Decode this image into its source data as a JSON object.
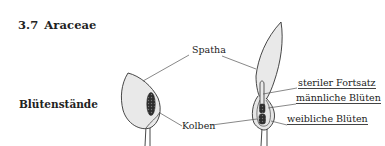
{
  "section": {
    "number": "3.7",
    "title": "Araceae"
  },
  "side_heading": "Blütenstände",
  "figure": {
    "labels": {
      "spatha": "Spatha",
      "kolben": "Kolben",
      "steriler_fortsatz": "steriler Fortsatz",
      "maennliche_blueten": "männliche Blüten",
      "weibliche_blueten": "weibliche Blüten"
    },
    "colors": {
      "spathe_fill": "#e9e9e9",
      "outline": "#333333",
      "spadix": "#3a3a3a",
      "leader_line": "#555555"
    }
  }
}
